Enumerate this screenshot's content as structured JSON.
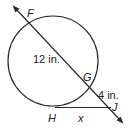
{
  "diagram": {
    "type": "circle-secant-tangent",
    "points": {
      "F": "F",
      "G": "G",
      "H": "H",
      "J": "J"
    },
    "measurements": {
      "FG": "12 in.",
      "GJ": "4 in.",
      "HJ": "x"
    },
    "colors": {
      "stroke": "#2a2a2a",
      "text": "#222222"
    }
  }
}
